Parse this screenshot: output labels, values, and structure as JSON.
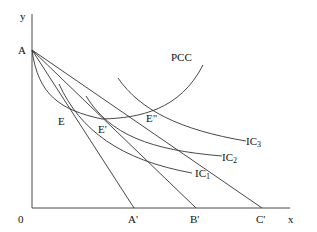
{
  "axes": {
    "x_label": "x",
    "y_label": "y",
    "origin_label": "0"
  },
  "points": {
    "A": "A",
    "A_prime": "A'",
    "B_prime": "B'",
    "C_prime": "C'",
    "E": "E",
    "E_prime": "E'",
    "E_double_prime": "E\""
  },
  "curves": {
    "pcc": "PCC",
    "ic1": {
      "base": "IC",
      "sub": "1"
    },
    "ic2": {
      "base": "IC",
      "sub": "2"
    },
    "ic3": {
      "base": "IC",
      "sub": "3"
    }
  },
  "colors": {
    "line": "#333333",
    "text": "#111111"
  }
}
